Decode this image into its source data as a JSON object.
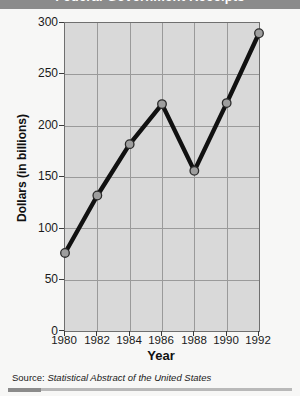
{
  "header": {
    "title": "Federal Government Receipts"
  },
  "source": {
    "label": "Source:",
    "title": "Statistical Abstract of the United States"
  },
  "chart_data": {
    "type": "line",
    "title": "",
    "xlabel": "Year",
    "ylabel": "Dollars (in billions)",
    "x": [
      1980,
      1982,
      1984,
      1986,
      1988,
      1990,
      1992
    ],
    "categories": [
      "1980",
      "1982",
      "1984",
      "1986",
      "1988",
      "1990",
      "1992"
    ],
    "values": [
      76,
      132,
      182,
      221,
      156,
      222,
      290
    ],
    "xlim": [
      1980,
      1992
    ],
    "ylim": [
      0,
      300
    ],
    "ytick_labels": [
      "0",
      "50",
      "100",
      "150",
      "200",
      "250",
      "300"
    ],
    "ytick_values": [
      0,
      50,
      100,
      150,
      200,
      250,
      300
    ],
    "xtick_labels": [
      "1980",
      "1982",
      "1984",
      "1986",
      "1988",
      "1990",
      "1992"
    ],
    "grid": true,
    "legend": "none",
    "marker": "circle",
    "colors": {
      "line": "#111111",
      "marker_fill": "#9e9e9e",
      "marker_edge": "#2b2b2b",
      "plot_background": "#d9d9d9",
      "grid": "#9a9a9a",
      "frame": "#6f6f6f",
      "page_background": "#f7f7f6",
      "header_band": "#8b8b8b"
    }
  }
}
